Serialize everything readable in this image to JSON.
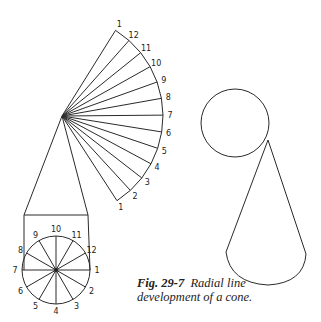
{
  "figure": {
    "number": "Fig. 29-7",
    "caption_line1": "Radial line",
    "caption_line2": "development of a cone."
  },
  "development": {
    "arc_labels": [
      "1",
      "12",
      "11",
      "10",
      "9",
      "8",
      "7",
      "6",
      "5",
      "4",
      "3",
      "2",
      "1"
    ]
  },
  "top_view": {
    "labels": [
      "1",
      "2",
      "3",
      "4",
      "5",
      "6",
      "7",
      "8",
      "9",
      "10",
      "11",
      "12"
    ]
  }
}
